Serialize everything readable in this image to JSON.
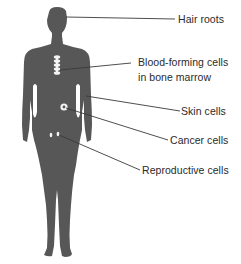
{
  "diagram": {
    "figure_color": "#575757",
    "marker_color": "#f4f4f4",
    "line_color": "#3a3a3a",
    "labels": [
      {
        "id": "hair-roots",
        "text": "Hair roots"
      },
      {
        "id": "blood-forming-cells",
        "line1": "Blood-forming cells",
        "line2": "in bone marrow"
      },
      {
        "id": "skin-cells",
        "text": "Skin cells"
      },
      {
        "id": "cancer-cells",
        "text": "Cancer cells"
      },
      {
        "id": "reproductive-cells",
        "text": "Reproductive cells"
      }
    ]
  }
}
